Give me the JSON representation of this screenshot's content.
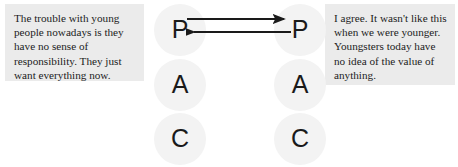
{
  "diagram": {
    "background_color": "#ffffff",
    "circle_fill_color": "#f3f3f3",
    "comment_background_color": "#ebebeb",
    "text_color": "#1c1c1c",
    "arrow_color": "#1a1a1a"
  },
  "comments": {
    "left": {
      "text": "The trouble with young people nowadays is they have no sense of responsibility.  They just want everything now.",
      "speaker": "person-left"
    },
    "right": {
      "text": "I agree. It wasn't like this when we were younger.  Youngsters today have no idea of the value of anything.",
      "speaker": "person-right"
    }
  },
  "ego_states": {
    "left_column": [
      {
        "letter": "P",
        "name": "parent"
      },
      {
        "letter": "A",
        "name": "adult"
      },
      {
        "letter": "C",
        "name": "child"
      }
    ],
    "right_column": [
      {
        "letter": "P",
        "name": "parent"
      },
      {
        "letter": "A",
        "name": "adult"
      },
      {
        "letter": "C",
        "name": "child"
      }
    ]
  },
  "transactions": [
    {
      "name": "stimulus-arrow",
      "from": "left-parent",
      "to": "right-parent",
      "direction": "right"
    },
    {
      "name": "response-arrow",
      "from": "right-parent",
      "to": "left-parent",
      "direction": "left"
    }
  ]
}
